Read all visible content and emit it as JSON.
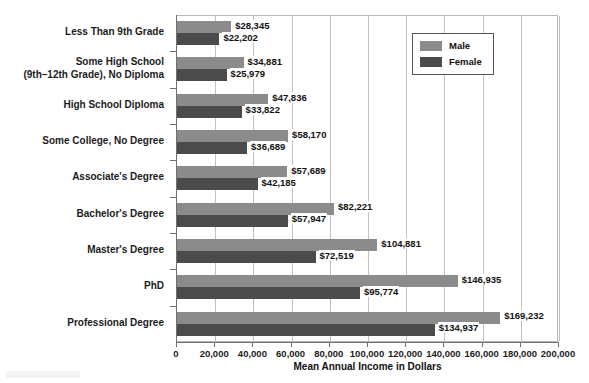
{
  "chart_data": {
    "type": "bar",
    "orientation": "horizontal",
    "title": "",
    "xlabel": "Mean Annual Income in Dollars",
    "ylabel": "",
    "xlim": [
      0,
      200000
    ],
    "xticks": [
      0,
      20000,
      40000,
      60000,
      80000,
      100000,
      120000,
      140000,
      160000,
      180000,
      200000
    ],
    "xtick_labels": [
      "0",
      "20,000",
      "40,000",
      "60,000",
      "80,000",
      "100,000",
      "120,000",
      "140,000",
      "160,000",
      "180,000",
      "200,000"
    ],
    "grid": true,
    "legend_position": "top-right",
    "categories": [
      "Less Than 9th Grade",
      "Some High School\n(9th–12th Grade), No Diploma",
      "High School Diploma",
      "Some College, No Degree",
      "Associate's Degree",
      "Bachelor's Degree",
      "Master's Degree",
      "PhD",
      "Professional Degree"
    ],
    "series": [
      {
        "name": "Male",
        "color": "#8b8b8b",
        "values": [
          28345,
          34881,
          47836,
          58170,
          57689,
          82221,
          104881,
          146935,
          169232
        ],
        "data_labels": [
          "$28,345",
          "$34,881",
          "$47,836",
          "$58,170",
          "$57,689",
          "$82,221",
          "$104,881",
          "$146,935",
          "$169,232"
        ]
      },
      {
        "name": "Female",
        "color": "#4b4b4b",
        "values": [
          22202,
          25979,
          33822,
          36689,
          42185,
          57947,
          72519,
          95774,
          134937
        ],
        "data_labels": [
          "$22,202",
          "$25,979",
          "$33,822",
          "$36,689",
          "$42,185",
          "$57,947",
          "$72,519",
          "$95,774",
          "$134,937"
        ]
      }
    ]
  },
  "legend": {
    "items": [
      {
        "label": "Male",
        "color": "#8b8b8b"
      },
      {
        "label": "Female",
        "color": "#4b4b4b"
      }
    ]
  },
  "category_labels": [
    {
      "line1": "Less Than 9th Grade",
      "line2": ""
    },
    {
      "line1": "Some High School",
      "line2": "(9th–12th Grade), No Diploma"
    },
    {
      "line1": "High School Diploma",
      "line2": ""
    },
    {
      "line1": "Some College, No Degree",
      "line2": ""
    },
    {
      "line1": "Associate's Degree",
      "line2": ""
    },
    {
      "line1": "Bachelor's Degree",
      "line2": ""
    },
    {
      "line1": "Master's Degree",
      "line2": ""
    },
    {
      "line1": "PhD",
      "line2": ""
    },
    {
      "line1": "Professional Degree",
      "line2": ""
    }
  ]
}
